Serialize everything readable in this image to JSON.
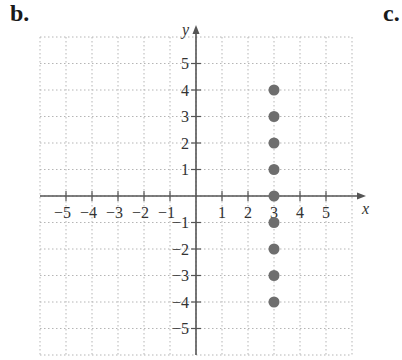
{
  "panels": {
    "left_label": "b.",
    "right_label": "c."
  },
  "chart_data": {
    "type": "scatter",
    "title": "",
    "xlabel": "x",
    "ylabel": "y",
    "xlim": [
      -6,
      6
    ],
    "ylim": [
      -6,
      6
    ],
    "grid": true,
    "grid_style": "dotted",
    "x_ticks": [
      -5,
      -4,
      -3,
      -2,
      -1,
      1,
      2,
      3,
      4,
      5
    ],
    "y_ticks": [
      -5,
      -4,
      -3,
      -2,
      -1,
      1,
      2,
      3,
      4,
      5
    ],
    "series": [
      {
        "name": "points",
        "color": "#6e6e6e",
        "points": [
          [
            3,
            4
          ],
          [
            3,
            3
          ],
          [
            3,
            2
          ],
          [
            3,
            1
          ],
          [
            3,
            0
          ],
          [
            3,
            -1
          ],
          [
            3,
            -2
          ],
          [
            3,
            -3
          ],
          [
            3,
            -4
          ]
        ]
      }
    ]
  }
}
